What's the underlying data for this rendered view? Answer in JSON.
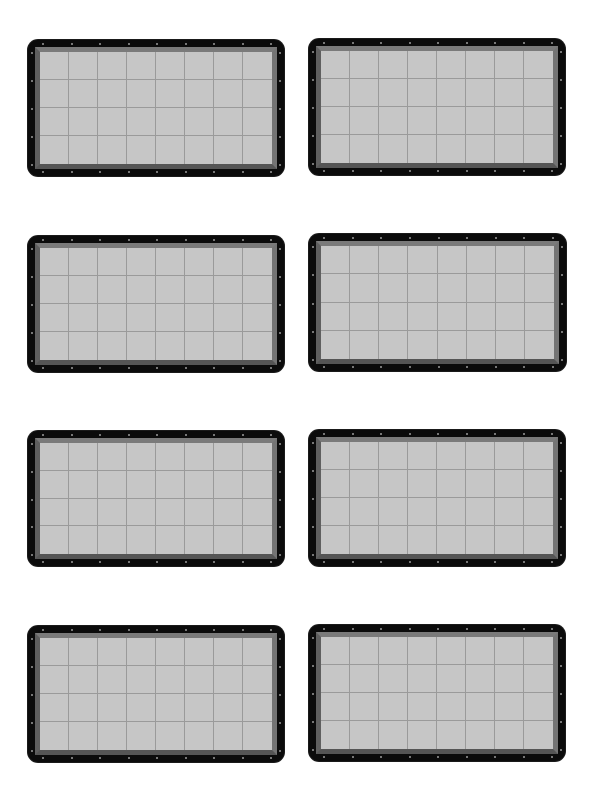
{
  "sheet": {
    "background": "#ffffff",
    "layout": {
      "columns": 2,
      "rows": 4
    }
  },
  "panel_style": {
    "frame_color": "#0b0b0b",
    "bevel_color": "#6d6d6d",
    "field_color": "#c6c6c6",
    "grid_line_color": "#9a9a9a",
    "grommet_color": "#9c9c9c",
    "grid_columns": 8,
    "grid_rows": 4,
    "grommets_top": 9,
    "grommets_side": 5
  },
  "panels": [
    {
      "id": "panel-r1-c1",
      "x": 28,
      "y": 40,
      "w": 256,
      "h": 136
    },
    {
      "id": "panel-r1-c2",
      "x": 309,
      "y": 39,
      "w": 256,
      "h": 136
    },
    {
      "id": "panel-r2-c1",
      "x": 28,
      "y": 236,
      "w": 256,
      "h": 136
    },
    {
      "id": "panel-r2-c2",
      "x": 309,
      "y": 234,
      "w": 257,
      "h": 137
    },
    {
      "id": "panel-r3-c1",
      "x": 28,
      "y": 431,
      "w": 256,
      "h": 135
    },
    {
      "id": "panel-r3-c2",
      "x": 309,
      "y": 430,
      "w": 256,
      "h": 136
    },
    {
      "id": "panel-r4-c1",
      "x": 28,
      "y": 626,
      "w": 256,
      "h": 136
    },
    {
      "id": "panel-r4-c2",
      "x": 309,
      "y": 625,
      "w": 256,
      "h": 136
    }
  ]
}
